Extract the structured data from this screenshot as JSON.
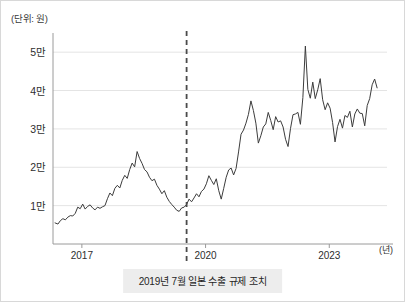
{
  "figure": {
    "unit_label": "(단위: 원)",
    "caption": "2019년 7월 일본 수출 규제 조치",
    "line_color": "#3c3c3c",
    "grid_color": "#e4e4e4",
    "axis_color": "#9a9a9a",
    "event_line_color": "#4a4a4a",
    "caption_bg_color": "#ededed",
    "background_color": "#ffffff"
  },
  "chart_data": {
    "type": "line",
    "title": "",
    "subtitle": "",
    "xlabel": "(년)",
    "ylabel": "(단위: 원)",
    "grid": true,
    "legend": false,
    "legend_position": "none",
    "xlim": [
      2016.3,
      2024.4
    ],
    "ylim": [
      0,
      55000
    ],
    "yticks": [
      10000,
      20000,
      30000,
      40000,
      50000
    ],
    "ytick_labels": [
      "1만",
      "2만",
      "3만",
      "4만",
      "5만"
    ],
    "xticks": [
      2017,
      2020,
      2023
    ],
    "xtick_labels": [
      "2017",
      "2020",
      "2023"
    ],
    "annotations": [
      {
        "type": "vline",
        "x": 2019.54,
        "style": "dashed",
        "label": "2019년 7월 일본 수출 규제 조치"
      }
    ],
    "series": [
      {
        "name": "주가",
        "x": [
          2016.35,
          2016.42,
          2016.48,
          2016.54,
          2016.6,
          2016.66,
          2016.72,
          2016.78,
          2016.84,
          2016.9,
          2016.96,
          2017.02,
          2017.08,
          2017.14,
          2017.2,
          2017.26,
          2017.32,
          2017.38,
          2017.44,
          2017.5,
          2017.56,
          2017.62,
          2017.68,
          2017.74,
          2017.8,
          2017.86,
          2017.92,
          2017.98,
          2018.04,
          2018.1,
          2018.16,
          2018.22,
          2018.28,
          2018.34,
          2018.4,
          2018.46,
          2018.52,
          2018.58,
          2018.64,
          2018.7,
          2018.76,
          2018.82,
          2018.88,
          2018.94,
          2019.0,
          2019.06,
          2019.12,
          2019.18,
          2019.24,
          2019.3,
          2019.36,
          2019.42,
          2019.48,
          2019.54,
          2019.6,
          2019.66,
          2019.72,
          2019.78,
          2019.84,
          2019.9,
          2019.96,
          2020.02,
          2020.08,
          2020.14,
          2020.2,
          2020.26,
          2020.32,
          2020.38,
          2020.44,
          2020.5,
          2020.56,
          2020.62,
          2020.68,
          2020.74,
          2020.8,
          2020.86,
          2020.92,
          2020.98,
          2021.04,
          2021.1,
          2021.16,
          2021.22,
          2021.28,
          2021.34,
          2021.4,
          2021.46,
          2021.52,
          2021.58,
          2021.64,
          2021.7,
          2021.76,
          2021.82,
          2021.88,
          2021.94,
          2022.0,
          2022.06,
          2022.12,
          2022.18,
          2022.24,
          2022.3,
          2022.36,
          2022.42,
          2022.48,
          2022.54,
          2022.6,
          2022.66,
          2022.72,
          2022.78,
          2022.84,
          2022.9,
          2022.96,
          2023.02,
          2023.08,
          2023.14,
          2023.2,
          2023.26,
          2023.32,
          2023.38,
          2023.44,
          2023.5,
          2023.56,
          2023.62,
          2023.68,
          2023.74,
          2023.8,
          2023.86,
          2023.92,
          2023.98,
          2024.04,
          2024.1,
          2024.16
        ],
        "values": [
          5500,
          5200,
          6100,
          6600,
          6300,
          7000,
          7400,
          7300,
          8000,
          9600,
          9200,
          10400,
          9100,
          9800,
          10200,
          9400,
          8900,
          9600,
          9300,
          9700,
          10000,
          11800,
          13300,
          12600,
          14500,
          15300,
          14600,
          16600,
          17900,
          17100,
          19400,
          21100,
          20100,
          24100,
          22300,
          21000,
          19400,
          18800,
          17400,
          16500,
          16900,
          15300,
          14300,
          13100,
          13900,
          12200,
          11100,
          10300,
          9600,
          8800,
          8500,
          9400,
          9600,
          10300,
          11700,
          11000,
          12000,
          13100,
          12300,
          13700,
          14300,
          15700,
          17800,
          16600,
          15500,
          17000,
          13900,
          11700,
          14500,
          17400,
          19300,
          19800,
          18000,
          19700,
          24000,
          28600,
          29700,
          31500,
          33800,
          37300,
          34800,
          31500,
          26300,
          28200,
          30500,
          31300,
          34300,
          32200,
          29800,
          33200,
          31800,
          32100,
          30500,
          27300,
          25400,
          30100,
          33700,
          33900,
          34300,
          31200,
          38200,
          51600,
          40300,
          38000,
          42200,
          37900,
          40200,
          43100,
          37600,
          35000,
          36800,
          35400,
          31700,
          26600,
          30600,
          32500,
          30200,
          33500,
          33000,
          34600,
          30500,
          33900,
          35200,
          34100,
          34000,
          30800,
          36100,
          37900,
          41500,
          43000,
          40700
        ],
        "peak_values": [
          {
            "x": 2018.34,
            "y": 24100,
            "note": "2018 peak"
          },
          {
            "x": 2022.42,
            "y": 51600,
            "note": "2021-22 spike above 5만"
          },
          {
            "x": 2024.1,
            "y": 48200,
            "note": "late peak"
          },
          {
            "x": 2024.22,
            "y": 32200,
            "note": "final value"
          }
        ]
      }
    ]
  }
}
